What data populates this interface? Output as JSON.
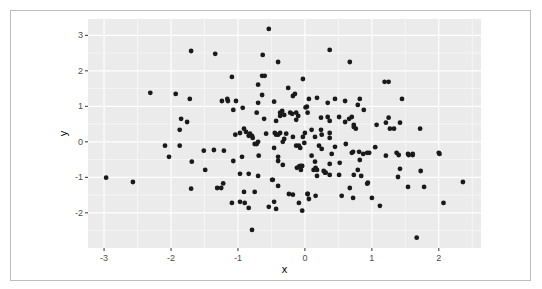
{
  "chart_data": {
    "type": "scatter",
    "title": "",
    "xlabel": "x",
    "ylabel": "y",
    "xlim": [
      -3.24,
      2.63
    ],
    "ylim": [
      -2.99,
      3.46
    ],
    "xticks": [
      -3,
      -2,
      -1,
      0,
      1,
      2
    ],
    "yticks": [
      -2,
      -1,
      0,
      1,
      2,
      3
    ],
    "xtick_labels": [
      "-3",
      "-2",
      "-1",
      "0",
      "1",
      "2"
    ],
    "ytick_labels": [
      "-2",
      "-1",
      "0",
      "1",
      "2",
      "3"
    ],
    "grid": true,
    "legend": "none",
    "colors": {
      "panel": "#ebebeb",
      "grid": "#ffffff",
      "point": "#1a1a1a",
      "frame": "#bdbdbd"
    },
    "points": [
      [
        -1.7,
        2.56
      ],
      [
        -1.34,
        2.48
      ],
      [
        -2.31,
        1.38
      ],
      [
        -1.93,
        1.35
      ],
      [
        -1.72,
        1.21
      ],
      [
        -1.24,
        1.15
      ],
      [
        -1.16,
        1.21
      ],
      [
        -1.85,
        0.65
      ],
      [
        -1.76,
        0.56
      ],
      [
        -1.87,
        0.34
      ],
      [
        -2.97,
        -1.01
      ],
      [
        -2.57,
        -1.13
      ],
      [
        -2.09,
        -0.11
      ],
      [
        -2.03,
        -0.42
      ],
      [
        -1.87,
        -0.11
      ],
      [
        -1.7,
        -1.32
      ],
      [
        -1.69,
        -0.56
      ],
      [
        -1.51,
        -0.25
      ],
      [
        -1.49,
        -0.79
      ],
      [
        -1.36,
        -0.23
      ],
      [
        -1.31,
        -1.3
      ],
      [
        -1.21,
        -0.25
      ],
      [
        -1.22,
        -1.17
      ],
      [
        -0.54,
        3.18
      ],
      [
        0.37,
        2.59
      ],
      [
        -0.63,
        2.45
      ],
      [
        -0.4,
        2.25
      ],
      [
        0.67,
        2.25
      ],
      [
        -1.09,
        1.83
      ],
      [
        -0.64,
        1.86
      ],
      [
        -0.6,
        1.86
      ],
      [
        -0.7,
        1.61
      ],
      [
        -0.03,
        1.77
      ],
      [
        -0.25,
        1.52
      ],
      [
        -0.18,
        1.29
      ],
      [
        -0.15,
        1.35
      ],
      [
        -1.15,
        1.15
      ],
      [
        -1.03,
        1.15
      ],
      [
        -0.64,
        1.32
      ],
      [
        -0.7,
        1.1
      ],
      [
        -0.46,
        1.13
      ],
      [
        0.06,
        1.21
      ],
      [
        0.18,
        1.24
      ],
      [
        0.34,
        1.1
      ],
      [
        0.45,
        1.21
      ],
      [
        0.6,
        1.15
      ],
      [
        0.82,
        1.21
      ],
      [
        0.79,
        1.04
      ],
      [
        1.19,
        1.69
      ],
      [
        1.25,
        1.69
      ],
      [
        1.45,
        1.21
      ],
      [
        -1.07,
        0.9
      ],
      [
        -0.93,
        0.96
      ],
      [
        -0.72,
        0.82
      ],
      [
        -0.61,
        0.65
      ],
      [
        -0.37,
        0.82
      ],
      [
        -0.34,
        0.87
      ],
      [
        -0.31,
        0.76
      ],
      [
        -0.37,
        0.73
      ],
      [
        -0.22,
        0.82
      ],
      [
        -0.19,
        0.79
      ],
      [
        -0.13,
        0.82
      ],
      [
        0.04,
        0.82
      ],
      [
        0.03,
        0.99
      ],
      [
        0.01,
        0.97
      ],
      [
        -0.43,
        0.59
      ],
      [
        -0.13,
        0.62
      ],
      [
        -0.1,
        0.73
      ],
      [
        0.24,
        0.68
      ],
      [
        0.34,
        0.7
      ],
      [
        0.37,
        0.59
      ],
      [
        0.6,
        0.56
      ],
      [
        0.7,
        0.7
      ],
      [
        0.88,
        0.9
      ],
      [
        1.07,
        0.48
      ],
      [
        1.25,
        0.68
      ],
      [
        -0.91,
        0.37
      ],
      [
        -0.88,
        0.28
      ],
      [
        -0.97,
        0.25
      ],
      [
        -0.84,
        0.17
      ],
      [
        -0.82,
        0.23
      ],
      [
        -0.79,
        0.17
      ],
      [
        -1.04,
        0.2
      ],
      [
        -0.7,
        0.0
      ],
      [
        -0.78,
        0.11
      ],
      [
        -0.72,
        -0.06
      ],
      [
        -0.75,
        -0.06
      ],
      [
        -0.58,
        0.23
      ],
      [
        -0.45,
        0.25
      ],
      [
        -0.43,
        0.2
      ],
      [
        -0.37,
        0.25
      ],
      [
        -0.4,
        0.2
      ],
      [
        -0.31,
        0.08
      ],
      [
        -0.28,
        0.23
      ],
      [
        -0.33,
        0.0
      ],
      [
        -0.18,
        0.14
      ],
      [
        -0.13,
        -0.11
      ],
      [
        -0.09,
        -0.11
      ],
      [
        -0.46,
        -0.17
      ],
      [
        0.1,
        0.34
      ],
      [
        0.24,
        0.34
      ],
      [
        0.37,
        0.25
      ],
      [
        0.51,
        0.7
      ],
      [
        0.66,
        0.65
      ],
      [
        0.73,
        0.42
      ],
      [
        0.76,
        0.37
      ],
      [
        0.73,
        0.48
      ],
      [
        0.25,
        0.2
      ],
      [
        0.37,
        0.11
      ],
      [
        0.15,
        0.14
      ],
      [
        0.0,
        0.25
      ],
      [
        -0.03,
        0.14
      ],
      [
        -0.01,
        -0.03
      ],
      [
        -0.07,
        -0.17
      ],
      [
        0.21,
        -0.11
      ],
      [
        0.25,
        -0.2
      ],
      [
        0.45,
        -0.14
      ],
      [
        0.61,
        -0.06
      ],
      [
        0.72,
        -0.28
      ],
      [
        0.7,
        -0.31
      ],
      [
        0.81,
        -0.28
      ],
      [
        0.87,
        -0.34
      ],
      [
        0.93,
        -0.31
      ],
      [
        1.05,
        -0.15
      ],
      [
        1.21,
        0.54
      ],
      [
        1.42,
        0.54
      ],
      [
        1.27,
        0.37
      ],
      [
        1.33,
        0.37
      ],
      [
        1.72,
        0.37
      ],
      [
        1.61,
        -0.37
      ],
      [
        1.61,
        -0.34
      ],
      [
        0.96,
        -0.31
      ],
      [
        0.1,
        -0.39
      ],
      [
        0.15,
        -0.56
      ],
      [
        0.4,
        -0.34
      ],
      [
        0.52,
        -0.59
      ],
      [
        0.37,
        -0.62
      ],
      [
        -1.07,
        -0.54
      ],
      [
        -0.94,
        -0.42
      ],
      [
        -0.69,
        -0.39
      ],
      [
        -0.4,
        -0.54
      ],
      [
        -0.4,
        -0.42
      ],
      [
        -0.33,
        -0.65
      ],
      [
        -0.12,
        -0.73
      ],
      [
        -0.09,
        -0.7
      ],
      [
        -0.07,
        -0.68
      ],
      [
        -0.06,
        -0.79
      ],
      [
        -0.97,
        -0.9
      ],
      [
        -0.84,
        -0.9
      ],
      [
        -0.7,
        -0.96
      ],
      [
        -0.49,
        -1.07
      ],
      [
        -0.48,
        -1.07
      ],
      [
        -0.4,
        -1.24
      ],
      [
        -1.25,
        -1.3
      ],
      [
        -0.91,
        -1.41
      ],
      [
        -0.75,
        -1.41
      ],
      [
        -0.24,
        -1.47
      ],
      [
        -0.18,
        -1.49
      ],
      [
        0.04,
        -1.47
      ],
      [
        -1.09,
        -1.72
      ],
      [
        -0.97,
        -1.69
      ],
      [
        -0.46,
        -1.69
      ],
      [
        -0.54,
        -1.83
      ],
      [
        -0.43,
        -1.89
      ],
      [
        -0.09,
        -1.72
      ],
      [
        -0.04,
        -1.94
      ],
      [
        -0.79,
        -2.48
      ],
      [
        -0.9,
        -1.72
      ],
      [
        -0.84,
        -1.86
      ],
      [
        -0.04,
        -0.68
      ],
      [
        0.13,
        -0.79
      ],
      [
        0.16,
        -0.73
      ],
      [
        0.28,
        -0.82
      ],
      [
        0.31,
        -0.87
      ],
      [
        0.37,
        -0.93
      ],
      [
        0.51,
        -0.93
      ],
      [
        0.18,
        -0.79
      ],
      [
        0.18,
        -0.96
      ],
      [
        0.3,
        -0.87
      ],
      [
        0.82,
        -0.51
      ],
      [
        0.79,
        -0.79
      ],
      [
        0.84,
        -0.96
      ],
      [
        0.73,
        -0.93
      ],
      [
        0.93,
        -1.18
      ],
      [
        0.94,
        -1.15
      ],
      [
        0.67,
        -1.3
      ],
      [
        0.04,
        -1.47
      ],
      [
        0.06,
        -1.61
      ],
      [
        0.16,
        -1.52
      ],
      [
        0.55,
        -1.52
      ],
      [
        0.72,
        -1.58
      ],
      [
        1.0,
        -1.58
      ],
      [
        1.12,
        -1.8
      ],
      [
        1.21,
        -0.39
      ],
      [
        1.37,
        -0.31
      ],
      [
        1.4,
        -0.37
      ],
      [
        1.54,
        -0.34
      ],
      [
        1.55,
        -0.37
      ],
      [
        1.42,
        -0.76
      ],
      [
        1.73,
        -0.82
      ],
      [
        1.39,
        -0.99
      ],
      [
        1.54,
        -1.27
      ],
      [
        1.78,
        -1.27
      ],
      [
        2.0,
        -0.31
      ],
      [
        2.01,
        -0.34
      ],
      [
        2.36,
        -1.13
      ],
      [
        2.07,
        -1.72
      ],
      [
        1.67,
        -2.7
      ]
    ]
  }
}
